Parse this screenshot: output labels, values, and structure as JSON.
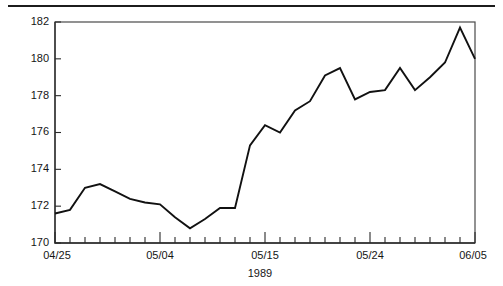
{
  "chart_data": {
    "type": "line",
    "title": "",
    "subtitle": "",
    "xlabel": "1989",
    "ylabel": "",
    "ylim": [
      170,
      182
    ],
    "xlim": [
      0,
      28
    ],
    "grid": false,
    "legend": null,
    "y_ticks": [
      170,
      172,
      174,
      176,
      178,
      180,
      182
    ],
    "y_tick_labels": [
      "170",
      "172",
      "174",
      "176",
      "178",
      "180",
      "182"
    ],
    "x_tick_labels": [
      "04/25",
      "05/04",
      "05/15",
      "05/24",
      "06/05"
    ],
    "x_labeled_indices": [
      0,
      7,
      14,
      21,
      28
    ],
    "x_minor_tick_count": 29,
    "x": [
      "04/25",
      "04/26",
      "04/27",
      "04/28",
      "05/01",
      "05/02",
      "05/03",
      "05/04",
      "05/05",
      "05/08",
      "05/09",
      "05/10",
      "05/11",
      "05/12",
      "05/15",
      "05/16",
      "05/17",
      "05/18",
      "05/19",
      "05/22",
      "05/23",
      "05/24",
      "05/25",
      "05/26",
      "05/30",
      "05/31",
      "06/01",
      "06/02",
      "06/05"
    ],
    "series": [
      {
        "name": "value",
        "color": "#111111",
        "values": [
          171.6,
          171.8,
          173.0,
          173.2,
          172.8,
          172.4,
          172.2,
          172.1,
          171.4,
          170.8,
          171.3,
          171.9,
          171.9,
          175.3,
          176.4,
          176.0,
          177.2,
          177.7,
          179.1,
          179.5,
          177.8,
          178.2,
          178.3,
          179.5,
          178.3,
          179.0,
          179.8,
          181.7,
          180.0
        ]
      }
    ]
  },
  "figure": {
    "top_rule_color": "#1c1c1c",
    "frame_color": "#4a4a4a",
    "background": "#ffffff"
  }
}
